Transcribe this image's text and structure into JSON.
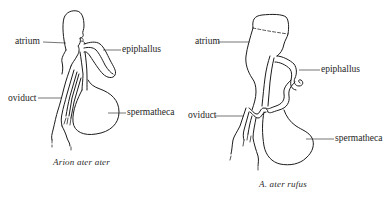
{
  "figures": [
    {
      "caption": "Arion ater ater",
      "labels": {
        "atrium": "atrium",
        "epiphallus": "epiphallus",
        "oviduct": "oviduct",
        "spermatheca": "spermatheca"
      }
    },
    {
      "caption": "A. ater rufus",
      "labels": {
        "atrium": "atrium",
        "epiphallus": "epiphallus",
        "oviduct": "oviduct",
        "spermatheca": "spermatheca"
      }
    }
  ],
  "colors": {
    "background": "#ffffff",
    "ink": "#1c1c1c"
  }
}
